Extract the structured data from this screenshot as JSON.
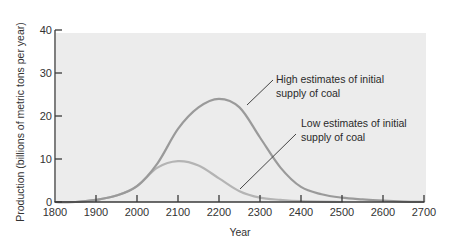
{
  "chart_data": {
    "type": "line",
    "title": "",
    "xlabel": "Year",
    "ylabel": "Production (billions of metric tons per year)",
    "xlim": [
      1800,
      2700
    ],
    "ylim": [
      0,
      40
    ],
    "x_ticks": [
      1800,
      1900,
      2000,
      2100,
      2200,
      2300,
      2400,
      2500,
      2600,
      2700
    ],
    "y_ticks": [
      0,
      10,
      20,
      30,
      40
    ],
    "grid": false,
    "legend": "none (inline annotations)",
    "series": [
      {
        "name": "High estimates of initial supply of coal",
        "color": "#9a9a9a",
        "x": [
          1800,
          1850,
          1900,
          1950,
          2000,
          2050,
          2100,
          2150,
          2200,
          2250,
          2300,
          2350,
          2400,
          2450,
          2500,
          2550,
          2600,
          2650,
          2700
        ],
        "values": [
          0,
          0,
          0.5,
          1.5,
          3.7,
          9,
          17,
          22,
          24,
          22,
          15,
          8,
          3.5,
          1.8,
          1,
          0.6,
          0.3,
          0.1,
          0
        ]
      },
      {
        "name": "Low estimates of initial supply of coal",
        "color": "#b4b4b4",
        "x": [
          1800,
          1850,
          1900,
          1950,
          2000,
          2050,
          2100,
          2150,
          2200,
          2250,
          2300,
          2350,
          2400,
          2500
        ],
        "values": [
          0,
          0,
          0.5,
          1.5,
          3.7,
          8,
          9.5,
          8.5,
          5.5,
          2.5,
          1,
          0.5,
          0.2,
          0
        ]
      }
    ],
    "annotations": [
      {
        "text_lines": [
          "High estimates of initial",
          "supply of coal"
        ],
        "points_to": "High estimates of initial supply of coal",
        "near": [
          2250,
          22
        ]
      },
      {
        "text_lines": [
          "Low estimates of initial",
          "supply of coal"
        ],
        "points_to": "Low estimates of initial supply of coal",
        "near": [
          2250,
          2.5
        ]
      }
    ]
  },
  "labels": {
    "xlabel": "Year",
    "ylabel": "Production (billions of metric tons per year)",
    "high_line1": "High estimates of initial",
    "high_line2": "supply of coal",
    "low_line1": "Low estimates of initial",
    "low_line2": "supply of coal"
  },
  "colors": {
    "plot_background": "#ececec",
    "axis": "#3a3a3a",
    "high_curve": "#9a9a9a",
    "low_curve": "#b8b8b8",
    "leader_line": "#444444"
  }
}
